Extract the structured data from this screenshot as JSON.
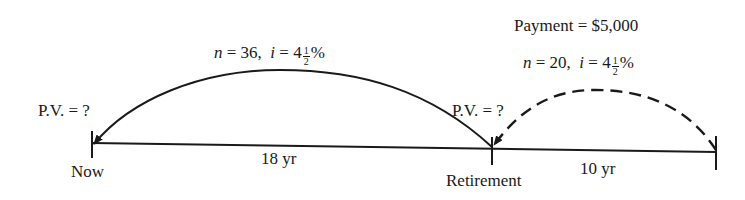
{
  "diagram": {
    "type": "timeline",
    "colors": {
      "ink": "#1a1a1a",
      "background": "#ffffff"
    },
    "points": [
      {
        "id": "now",
        "label": "Now"
      },
      {
        "id": "retirement",
        "label": "Retirement"
      },
      {
        "id": "end",
        "label": ""
      }
    ],
    "segments": [
      {
        "from": "now",
        "to": "retirement",
        "label": "18 yr"
      },
      {
        "from": "retirement",
        "to": "end",
        "label": "10 yr"
      }
    ],
    "arcs": [
      {
        "id": "arc-retirement-to-now",
        "style": "solid",
        "n_label": "n",
        "n_value": "36",
        "i_label": "i",
        "i_whole": "4",
        "i_num": "1",
        "i_den": "2",
        "i_unit": "%",
        "target_label": "P.V. = ?"
      },
      {
        "id": "arc-end-to-retirement",
        "style": "dashed",
        "payment_label": "Payment = $5,000",
        "n_label": "n",
        "n_value": "20",
        "i_label": "i",
        "i_whole": "4",
        "i_num": "1",
        "i_den": "2",
        "i_unit": "%",
        "target_label": "P.V. = ?"
      }
    ]
  }
}
